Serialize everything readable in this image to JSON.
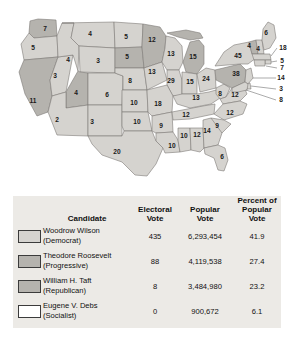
{
  "map": {
    "title": "1912 Presidential Election Electoral Vote Map",
    "colors": {
      "wilson": "#d5d3cf",
      "roosevelt": "#b5b3ae",
      "taft": "#b5b3ae",
      "debs": "#ffffff",
      "border": "#7d7b77",
      "background": "#ffffff"
    },
    "states": [
      {
        "code": "WA",
        "label": "7",
        "x": 45,
        "y": 29,
        "winner": "roosevelt"
      },
      {
        "code": "OR",
        "label": "5",
        "x": 33,
        "y": 48,
        "winner": "wilson"
      },
      {
        "code": "CA",
        "label": "11",
        "x": 33,
        "y": 101,
        "winner": "roosevelt"
      },
      {
        "code": "NV",
        "label": "3",
        "x": 55,
        "y": 76,
        "winner": "wilson"
      },
      {
        "code": "ID",
        "label": "4",
        "x": 68,
        "y": 60,
        "winner": "wilson"
      },
      {
        "code": "MT",
        "label": "4",
        "x": 90,
        "y": 34,
        "winner": "wilson"
      },
      {
        "code": "WY",
        "label": "3",
        "x": 98,
        "y": 61,
        "winner": "wilson"
      },
      {
        "code": "UT",
        "label": "4",
        "x": 76,
        "y": 93,
        "winner": "taft"
      },
      {
        "code": "AZ",
        "label": "2",
        "x": 57,
        "y": 120,
        "winner": "wilson"
      },
      {
        "code": "NM",
        "label": "3",
        "x": 92,
        "y": 122,
        "winner": "wilson"
      },
      {
        "code": "CO",
        "label": "6",
        "x": 107,
        "y": 95,
        "winner": "wilson"
      },
      {
        "code": "ND",
        "label": "5",
        "x": 126,
        "y": 37,
        "winner": "wilson"
      },
      {
        "code": "SD",
        "label": "5",
        "x": 127,
        "y": 57,
        "winner": "roosevelt"
      },
      {
        "code": "NE",
        "label": "8",
        "x": 130,
        "y": 81,
        "winner": "wilson"
      },
      {
        "code": "KS",
        "label": "10",
        "x": 134,
        "y": 103,
        "winner": "wilson"
      },
      {
        "code": "OK",
        "label": "10",
        "x": 137,
        "y": 122,
        "winner": "wilson"
      },
      {
        "code": "TX",
        "label": "20",
        "x": 117,
        "y": 152,
        "winner": "wilson"
      },
      {
        "code": "MN",
        "label": "12",
        "x": 152,
        "y": 40,
        "winner": "roosevelt"
      },
      {
        "code": "IA",
        "label": "13",
        "x": 152,
        "y": 72,
        "winner": "wilson"
      },
      {
        "code": "WI",
        "label": "13",
        "x": 171,
        "y": 54,
        "winner": "wilson"
      },
      {
        "code": "MI",
        "label": "15",
        "x": 193,
        "y": 57,
        "winner": "roosevelt"
      },
      {
        "code": "IL",
        "label": "29",
        "x": 171,
        "y": 81,
        "winner": "wilson"
      },
      {
        "code": "IN",
        "label": "15",
        "x": 190,
        "y": 82,
        "winner": "wilson"
      },
      {
        "code": "OH",
        "label": "24",
        "x": 206,
        "y": 79,
        "winner": "wilson"
      },
      {
        "code": "MO",
        "label": "18",
        "x": 158,
        "y": 104,
        "winner": "wilson"
      },
      {
        "code": "AR",
        "label": "9",
        "x": 161,
        "y": 126,
        "winner": "wilson"
      },
      {
        "code": "LA",
        "label": "10",
        "x": 172,
        "y": 146,
        "winner": "wilson"
      },
      {
        "code": "MS",
        "label": "10",
        "x": 184,
        "y": 136,
        "winner": "wilson"
      },
      {
        "code": "AL",
        "label": "12",
        "x": 197,
        "y": 135,
        "winner": "wilson"
      },
      {
        "code": "TN",
        "label": "12",
        "x": 186,
        "y": 115,
        "winner": "wilson"
      },
      {
        "code": "KY",
        "label": "13",
        "x": 196,
        "y": 98,
        "winner": "wilson"
      },
      {
        "code": "WV",
        "label": "8",
        "x": 220,
        "y": 94,
        "winner": "wilson"
      },
      {
        "code": "VA",
        "label": "12",
        "x": 235,
        "y": 95,
        "winner": "wilson"
      },
      {
        "code": "NC",
        "label": "12",
        "x": 230,
        "y": 113,
        "winner": "wilson"
      },
      {
        "code": "SC",
        "label": "9",
        "x": 217,
        "y": 126,
        "winner": "wilson"
      },
      {
        "code": "GA",
        "label": "14",
        "x": 207,
        "y": 131,
        "winner": "wilson"
      },
      {
        "code": "FL",
        "label": "6",
        "x": 222,
        "y": 157,
        "winner": "wilson"
      },
      {
        "code": "PA",
        "label": "38",
        "x": 236,
        "y": 74,
        "winner": "wilson"
      },
      {
        "code": "NY",
        "label": "45",
        "x": 238,
        "y": 56,
        "winner": "wilson"
      },
      {
        "code": "VT",
        "label": "4",
        "x": 249,
        "y": 46,
        "winner": "taft"
      },
      {
        "code": "NH",
        "label": "4",
        "x": 258,
        "y": 49,
        "winner": "wilson"
      },
      {
        "code": "ME",
        "label": "6",
        "x": 266,
        "y": 33,
        "winner": "wilson"
      },
      {
        "code": "MA",
        "label": "18",
        "x": 283,
        "y": 48,
        "winner": "wilson"
      },
      {
        "code": "RI",
        "label": "5",
        "x": 282,
        "y": 61,
        "winner": "wilson"
      },
      {
        "code": "CT",
        "label": "7",
        "x": 282,
        "y": 68,
        "winner": "wilson"
      },
      {
        "code": "NJ",
        "label": "14",
        "x": 281,
        "y": 78,
        "winner": "wilson"
      },
      {
        "code": "DE",
        "label": "3",
        "x": 281,
        "y": 89,
        "winner": "wilson"
      },
      {
        "code": "MD",
        "label": "8",
        "x": 281,
        "y": 100,
        "winner": "wilson"
      }
    ]
  },
  "table": {
    "headers": {
      "candidate": "Candidate",
      "electoral_vote_l1": "Electoral",
      "electoral_vote_l2": "Vote",
      "popular_vote_l1": "Popular",
      "popular_vote_l2": "Vote",
      "percent_l1": "Percent of",
      "percent_l2": "Popular Vote"
    },
    "rows": [
      {
        "swatch": "wilson-swatch",
        "name": "Woodrow Wilson",
        "party": "(Democrat)",
        "electoral_vote": "435",
        "popular_vote": "6,293,454",
        "percent": "41.9"
      },
      {
        "swatch": "roosevelt-swatch",
        "name": "Theodore Roosevelt",
        "party": "(Progressive)",
        "electoral_vote": "88",
        "popular_vote": "4,119,538",
        "percent": "27.4"
      },
      {
        "swatch": "taft-swatch",
        "name": "William H. Taft",
        "party": "(Republican)",
        "electoral_vote": "8",
        "popular_vote": "3,484,980",
        "percent": "23.2"
      },
      {
        "swatch": "debs-swatch",
        "name": "Eugene V. Debs",
        "party": "(Socialist)",
        "electoral_vote": "0",
        "popular_vote": "900,672",
        "percent": "6.1"
      }
    ]
  }
}
